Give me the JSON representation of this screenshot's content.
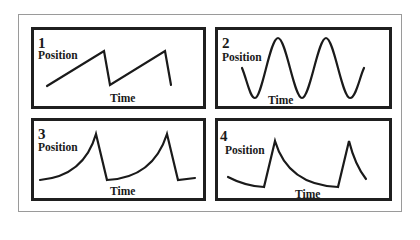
{
  "panels": [
    {
      "number": "1",
      "y_label": "Position",
      "x_label": "Time",
      "shape": "sawtooth (linear rise, sharp drop)"
    },
    {
      "number": "2",
      "y_label": "Position",
      "x_label": "Time",
      "shape": "sinusoidal oscillation"
    },
    {
      "number": "3",
      "y_label": "Position",
      "x_label": "Time",
      "shape": "accelerating curved rise, sharp linear drop"
    },
    {
      "number": "4",
      "y_label": "Position",
      "x_label": "Time",
      "shape": "sharp linear rise, decaying curved fall"
    }
  ],
  "colors": {
    "line": "#1a1a1a",
    "frame": "#1f1f1f",
    "outer_border": "#9a9a9a",
    "background": "#ffffff"
  }
}
